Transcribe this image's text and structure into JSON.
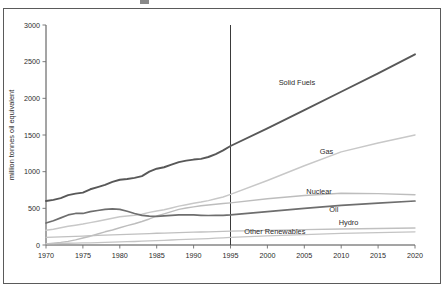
{
  "figure": {
    "background_color": "#ffffff",
    "border_color": "#5a5a5a",
    "axis_color": "#4a4a4a"
  },
  "chart_data": {
    "type": "line",
    "title": "",
    "xlabel": "",
    "ylabel": "million tonnes oil equivalent",
    "xlim": [
      1970,
      2020
    ],
    "ylim": [
      0,
      3000
    ],
    "grid": false,
    "legend_position": "inline-labels",
    "xticks": [
      1970,
      1975,
      1980,
      1985,
      1990,
      1995,
      2000,
      2005,
      2010,
      2015,
      2020
    ],
    "xtick_labels": [
      "1970",
      "1975",
      "1980",
      "1985",
      "1990",
      "1995",
      "2000",
      "2005",
      "2010",
      "2015",
      "2020"
    ],
    "yticks": [
      0,
      500,
      1000,
      1500,
      2000,
      2500,
      3000
    ],
    "ytick_labels": [
      "0",
      "500",
      "1000",
      "1500",
      "2000",
      "2500",
      "3000"
    ],
    "annotations": [
      {
        "name": "projection-divider",
        "type": "vline",
        "x": 1995,
        "note": "history / projection boundary"
      }
    ],
    "x": [
      1970,
      1971,
      1972,
      1973,
      1974,
      1975,
      1976,
      1977,
      1978,
      1979,
      1980,
      1981,
      1982,
      1983,
      1984,
      1985,
      1986,
      1987,
      1988,
      1989,
      1990,
      1991,
      1992,
      1993,
      1994,
      1995,
      2000,
      2005,
      2010,
      2015,
      2020
    ],
    "series": [
      {
        "name": "Solid Fuels",
        "color": "#585858",
        "width": 1.9,
        "label_x": 2004,
        "label_y": 2180,
        "values": [
          600,
          615,
          640,
          680,
          700,
          715,
          760,
          790,
          820,
          860,
          890,
          900,
          915,
          940,
          1000,
          1040,
          1060,
          1095,
          1130,
          1150,
          1165,
          1175,
          1200,
          1240,
          1290,
          1350,
          1590,
          1840,
          2090,
          2340,
          2600
        ]
      },
      {
        "name": "Gas",
        "color": "#c8c8c8",
        "width": 1.5,
        "label_x": 2008,
        "label_y": 1240,
        "values": [
          200,
          215,
          235,
          255,
          270,
          285,
          305,
          325,
          345,
          365,
          385,
          395,
          405,
          420,
          445,
          465,
          480,
          505,
          530,
          550,
          570,
          585,
          605,
          630,
          655,
          690,
          880,
          1080,
          1270,
          1390,
          1500
        ]
      },
      {
        "name": "Nuclear",
        "color": "#bdbdbd",
        "width": 1.4,
        "label_x": 2007,
        "label_y": 700,
        "values": [
          15,
          25,
          35,
          50,
          70,
          95,
          120,
          150,
          180,
          205,
          235,
          265,
          290,
          320,
          355,
          395,
          425,
          455,
          485,
          505,
          520,
          535,
          545,
          555,
          565,
          575,
          630,
          675,
          705,
          700,
          685
        ]
      },
      {
        "name": "Oil",
        "color": "#6e6e6e",
        "width": 1.7,
        "label_x": 2009,
        "label_y": 455,
        "values": [
          300,
          330,
          370,
          410,
          430,
          430,
          455,
          470,
          485,
          492,
          485,
          460,
          430,
          405,
          395,
          390,
          398,
          405,
          410,
          412,
          410,
          405,
          402,
          403,
          405,
          410,
          455,
          500,
          540,
          572,
          600
        ]
      },
      {
        "name": "Hydro",
        "color": "#c0c0c0",
        "width": 1.3,
        "label_x": 2011,
        "label_y": 268,
        "values": [
          105,
          108,
          112,
          115,
          118,
          122,
          126,
          130,
          134,
          138,
          142,
          145,
          148,
          152,
          156,
          160,
          163,
          166,
          169,
          172,
          175,
          177,
          180,
          183,
          186,
          190,
          200,
          210,
          218,
          225,
          232
        ]
      },
      {
        "name": "Other Renewables",
        "color": "#c4c4c4",
        "width": 1.3,
        "label_x": 2001,
        "label_y": 150,
        "values": [
          18,
          20,
          22,
          24,
          26,
          28,
          30,
          33,
          36,
          39,
          42,
          45,
          48,
          52,
          56,
          60,
          64,
          68,
          72,
          76,
          80,
          84,
          88,
          93,
          98,
          104,
          124,
          142,
          158,
          170,
          180
        ]
      }
    ]
  }
}
